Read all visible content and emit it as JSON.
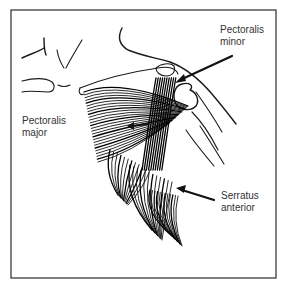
{
  "figure": {
    "type": "anatomical-illustration",
    "labels": [
      {
        "id": "pectoralis-minor",
        "lines": [
          "Pectoralis",
          "minor"
        ],
        "has_arrow": true
      },
      {
        "id": "pectoralis-major",
        "lines": [
          "Pectoralis",
          "major"
        ],
        "has_arrow": false
      },
      {
        "id": "serratus-anterior",
        "lines": [
          "Serratus",
          "anterior"
        ],
        "has_arrow": true
      }
    ],
    "colors": {
      "ink": "#111111",
      "frame": "#4a4a4a",
      "label_text": "#333333",
      "background": "#ffffff"
    }
  }
}
